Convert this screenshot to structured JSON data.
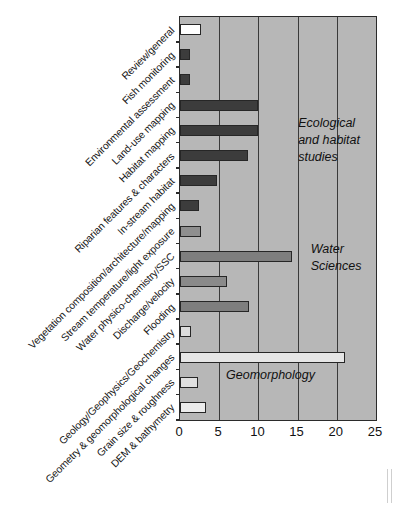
{
  "chart_data": {
    "type": "bar",
    "orientation": "horizontal",
    "title": "",
    "xlabel": "",
    "ylabel": "",
    "xlim": [
      0,
      25
    ],
    "xticks": [
      0,
      5,
      10,
      15,
      20,
      25
    ],
    "grid": true,
    "legend": false,
    "categories": [
      "Review/general",
      "Fish monitoring",
      "Environmental assessment",
      "Land-use mapping",
      "Habitat mapping",
      "Riparian features & characters",
      "In-stream habitat",
      "Vegetation composition/architecture/mapping",
      "Stream temperature/light exposure",
      "Water physico-chemistry/SSC",
      "Discharge/velocity",
      "Flooding",
      "Geology/Geophysics/Geochemistry",
      "Geometry & geomorphological changes",
      "Grain size & roughness",
      "DEM & bathymetry"
    ],
    "values": [
      2.7,
      1.3,
      1.3,
      10,
      10,
      8.7,
      4.7,
      2.4,
      2.7,
      14.3,
      6,
      8.8,
      1.4,
      21,
      2.3,
      3.3
    ],
    "bar_colors": [
      "#ffffff",
      "#3c3c3c",
      "#3c3c3c",
      "#3c3c3c",
      "#3c3c3c",
      "#3c3c3c",
      "#3c3c3c",
      "#3c3c3c",
      "#8f8f8f",
      "#7e7e7e",
      "#8a8a8a",
      "#7e7e7e",
      "#dcdcdc",
      "#e6e6e6",
      "#e0e0e0",
      "#ececec"
    ],
    "annotations": [
      {
        "text": "Ecological\nand habitat\nstudies",
        "x": 15.2,
        "category_index": 4
      },
      {
        "text": "Water\nSciences",
        "x": 16.8,
        "category_index": 9
      },
      {
        "text": "Geomorphology",
        "x": 6.0,
        "category_index": 14
      }
    ],
    "plot_background": "#b7b7b7",
    "grid_color": "#3a3a3a",
    "axis_color": "#2b2b2b"
  },
  "annotation_labels": {
    "ecological": "Ecological",
    "ecological2": "and habitat",
    "ecological3": "studies",
    "water": "Water",
    "water2": "Sciences",
    "geomorphology": "Geomorphology"
  }
}
